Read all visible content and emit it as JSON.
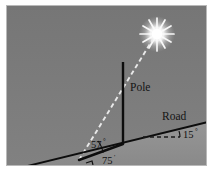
{
  "figure": {
    "panel": {
      "background_top_color": "#7b7b7b",
      "background_bottom_color": "#8e8e8e",
      "border_color": "#b9b9b9",
      "page_background_color": "#ffffff"
    },
    "labels": {
      "pole": "Pole",
      "road": "Road",
      "angle_elevation": "57",
      "angle_elevation_unit": "°",
      "angle_incline": "15",
      "angle_incline_unit": "°",
      "base_distance": "75",
      "base_distance_unit": "'"
    },
    "icons": {
      "sun": "sun-burst-icon"
    },
    "colors": {
      "pole_line": "#0d0d0d",
      "ground_line": "#0d0d0d",
      "base_line": "#0d0d0d",
      "sun_ray_dashed": "#efefef",
      "horizontal_reference_dashed": "#1a1a1a",
      "sun_core": "#ffffff",
      "sun_glow": "#f2f2f2",
      "label_text": "#141414"
    },
    "geometry": {
      "vertex": {
        "x": 72,
        "y": 154
      },
      "pole_base": {
        "x": 116,
        "y": 138
      },
      "pole_top": {
        "x": 116,
        "y": 56
      },
      "sun": {
        "x": 150,
        "y": 28
      },
      "ground_left": {
        "x": 2,
        "y": 164
      },
      "ground_right": {
        "x": 201,
        "y": 116
      },
      "reference_dash_left": {
        "x": 140,
        "y": 131
      },
      "reference_dash_right": {
        "x": 172,
        "y": 131
      }
    }
  }
}
